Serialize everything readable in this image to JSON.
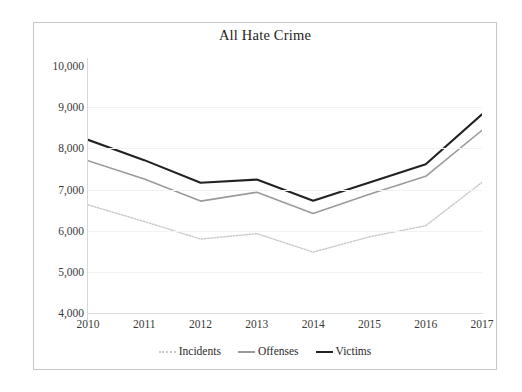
{
  "figure": {
    "title": "All Hate Crime",
    "background_color": "#ffffff",
    "frame_color": "#c9c9c9"
  },
  "chart_data": {
    "type": "line",
    "title": "All Hate Crime",
    "xlabel": "",
    "ylabel": "",
    "categories": [
      "2010",
      "2011",
      "2012",
      "2013",
      "2014",
      "2015",
      "2016",
      "2017"
    ],
    "x": [
      2010,
      2011,
      2012,
      2013,
      2014,
      2015,
      2016,
      2017
    ],
    "ylim": [
      4000,
      10000
    ],
    "yticks": [
      4000,
      5000,
      6000,
      7000,
      8000,
      9000,
      10000
    ],
    "ytick_labels": [
      "4,000",
      "5,000",
      "6,000",
      "7,000",
      "8,000",
      "9,000",
      "10,000"
    ],
    "grid": true,
    "grid_axis": "y",
    "legend_position": "bottom",
    "series": [
      {
        "name": "Incidents",
        "color": "#c8c8c8",
        "line_style": "dotted",
        "line_width": 1.4,
        "values": [
          6628,
          6222,
          5796,
          5928,
          5479,
          5850,
          6121,
          7175
        ]
      },
      {
        "name": "Offenses",
        "color": "#9a9a9a",
        "line_style": "solid",
        "line_width": 1.6,
        "values": [
          7699,
          7254,
          6718,
          6933,
          6418,
          6885,
          7321,
          8437
        ]
      },
      {
        "name": "Victims",
        "color": "#222222",
        "line_style": "solid",
        "line_width": 2.1,
        "values": [
          8208,
          7713,
          7164,
          7242,
          6727,
          7173,
          7615,
          8828
        ]
      }
    ]
  },
  "legend": {
    "items": [
      {
        "label": "Incidents",
        "color": "#c8c8c8",
        "style": "dotted"
      },
      {
        "label": "Offenses",
        "color": "#9a9a9a",
        "style": "solid"
      },
      {
        "label": "Victims",
        "color": "#222222",
        "style": "solid"
      }
    ]
  }
}
